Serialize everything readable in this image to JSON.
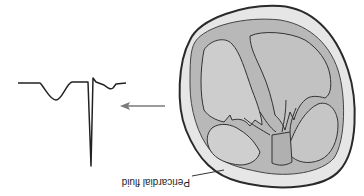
{
  "diagram": {
    "orientation": "rotated-180",
    "labels": {
      "pericardial_fluid": "Pericardial fluid"
    },
    "elements": {
      "ecg_trace": "ECG waveform with inverted T waves and deep S wave",
      "arrow": "arrow pointing from heart toward ECG trace",
      "heart": "cross-section of heart within pericardial sac"
    },
    "colors": {
      "outline": "#2a2a2a",
      "pericardial_fluid": "#e4e4e4",
      "myocardium": "#b4b4b4",
      "chambers": "#c9c9c9",
      "arrow": "#7a7a7a",
      "background": "#ffffff"
    }
  }
}
